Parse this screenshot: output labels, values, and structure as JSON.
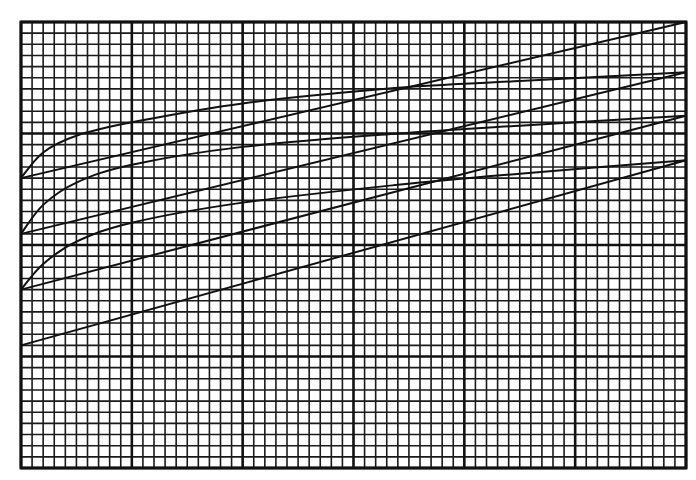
{
  "chart_data": {
    "type": "line",
    "title": "",
    "xlabel": "",
    "ylabel": "",
    "xlim": [
      0,
      60
    ],
    "ylim": [
      0,
      40
    ],
    "grid": {
      "on": true,
      "minor_step": 1,
      "major_step": 10,
      "x_major_count": 6,
      "y_major_count": 4
    },
    "legend": "none",
    "tick_labels": {
      "x": [],
      "y": []
    },
    "series": [
      {
        "name": "line-1",
        "kind": "straight",
        "x": [
          0,
          60
        ],
        "y": [
          26,
          40
        ]
      },
      {
        "name": "curve-1",
        "kind": "curve",
        "x": [
          0,
          2,
          5,
          10,
          20,
          34,
          45,
          60
        ],
        "y": [
          26,
          28.3,
          29.8,
          31.0,
          32.7,
          34.1,
          34.7,
          35.5
        ]
      },
      {
        "name": "line-2",
        "kind": "straight",
        "x": [
          0,
          60
        ],
        "y": [
          21,
          35.5
        ]
      },
      {
        "name": "curve-2",
        "kind": "curve",
        "x": [
          0,
          2,
          5,
          10,
          20,
          34,
          45,
          60
        ],
        "y": [
          21,
          23.6,
          25.6,
          27.2,
          28.8,
          30.0,
          30.7,
          31.6
        ]
      },
      {
        "name": "line-3",
        "kind": "straight",
        "x": [
          0,
          60
        ],
        "y": [
          16,
          31.6
        ]
      },
      {
        "name": "curve-3",
        "kind": "curve",
        "x": [
          0,
          2,
          5,
          10,
          20,
          34,
          45,
          60
        ],
        "y": [
          16,
          18.3,
          20.3,
          22.0,
          23.8,
          25.4,
          26.4,
          27.6
        ]
      },
      {
        "name": "line-4",
        "kind": "straight",
        "x": [
          0,
          60
        ],
        "y": [
          11,
          27.6
        ]
      }
    ],
    "annotations": []
  },
  "plot_area": {
    "left": 21,
    "top": 22,
    "right": 686,
    "bottom": 468
  },
  "colors": {
    "ink": "#111111",
    "paper": "#ffffff"
  },
  "aria": {
    "chart_label": "Graph paper chart with three concave curves and four straight lines"
  }
}
